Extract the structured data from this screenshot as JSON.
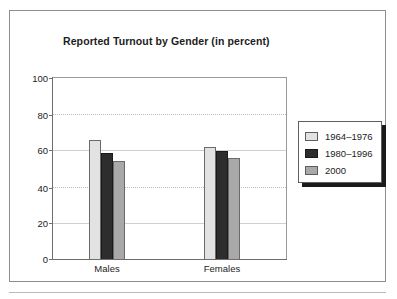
{
  "chart_data": {
    "type": "bar",
    "title": "Reported Turnout by Gender (in percent)",
    "xlabel": "",
    "ylabel": "",
    "categories": [
      "Males",
      "Females"
    ],
    "series": [
      {
        "name": "1964–1976",
        "color": "#e2e2e2",
        "values": [
          66,
          62
        ]
      },
      {
        "name": "1980–1996",
        "color": "#2d2d2d",
        "values": [
          58.5,
          59.5
        ]
      },
      {
        "name": "2000",
        "color": "#a9a9a9",
        "values": [
          54,
          56
        ]
      }
    ],
    "ylim": [
      0,
      100
    ],
    "yticks": [
      0,
      20,
      40,
      60,
      80,
      100
    ],
    "ytick_labels": [
      "0",
      "20",
      "40",
      "60",
      "80",
      "100"
    ],
    "gridline_styles": {
      "20": "solid",
      "40": "dotted",
      "60": "solid",
      "80": "dotted",
      "100": "none"
    },
    "grid": true,
    "legend_position": "right"
  },
  "legend": {
    "items": [
      {
        "label": "1964–1976"
      },
      {
        "label": "1980–1996"
      },
      {
        "label": "2000"
      }
    ]
  },
  "axis": {
    "y_labels": [
      "100",
      "80",
      "60",
      "40",
      "20",
      "0"
    ]
  },
  "categories": [
    {
      "label": "Males"
    },
    {
      "label": "Females"
    }
  ]
}
